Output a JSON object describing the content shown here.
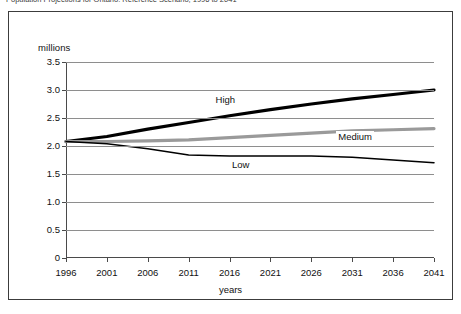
{
  "figure": {
    "caption_partial": "Population Projections for Ontario: Reference Scenario, 1996 to 2041",
    "frame_border_color": "#3c3c3c"
  },
  "chart_data": {
    "type": "line",
    "title": "",
    "xlabel": "years",
    "ylabel": "millions",
    "xlim": [
      1996,
      2041
    ],
    "ylim": [
      0,
      3.5
    ],
    "grid": true,
    "legend_position": "inline-annotations",
    "x": [
      1996,
      2001,
      2006,
      2011,
      2016,
      2021,
      2026,
      2031,
      2036,
      2041
    ],
    "ytick_labels": [
      "0",
      "0.5",
      "1.0",
      "1.5",
      "2.0",
      "2.5",
      "3.0",
      "3.5"
    ],
    "ytick_values": [
      0,
      0.5,
      1.0,
      1.5,
      2.0,
      2.5,
      3.0,
      3.5
    ],
    "xtick_labels": [
      "1996",
      "2001",
      "2006",
      "2011",
      "2016",
      "2021",
      "2026",
      "2031",
      "2036",
      "2041"
    ],
    "series": [
      {
        "name": "High",
        "color": "#000000",
        "width": 3.2,
        "values": [
          2.08,
          2.17,
          2.3,
          2.42,
          2.54,
          2.65,
          2.75,
          2.84,
          2.92,
          3.0
        ]
      },
      {
        "name": "Medium",
        "color": "#9a9a9a",
        "width": 3.2,
        "values": [
          2.08,
          2.08,
          2.09,
          2.11,
          2.15,
          2.19,
          2.23,
          2.27,
          2.29,
          2.31
        ]
      },
      {
        "name": "Low",
        "color": "#000000",
        "width": 1.5,
        "values": [
          2.08,
          2.04,
          1.95,
          1.84,
          1.82,
          1.82,
          1.82,
          1.8,
          1.75,
          1.7
        ]
      }
    ],
    "annotations": [
      {
        "text": "High",
        "x": 2016,
        "y": 2.8
      },
      {
        "text": "Medium",
        "x": 2031,
        "y": 2.14
      },
      {
        "text": "Low",
        "x": 2018,
        "y": 1.64
      }
    ]
  }
}
